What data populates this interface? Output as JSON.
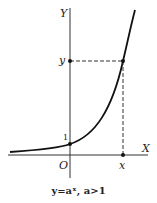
{
  "figure": {
    "y_axis_label": "Y",
    "x_axis_label": "X",
    "origin_label": "O",
    "intercept_label": "1",
    "point_y_label": "y",
    "point_x_label": "x",
    "caption": "y=aˣ, a>1"
  },
  "colors": {
    "stroke": "#222222",
    "background": "#ffffff"
  }
}
